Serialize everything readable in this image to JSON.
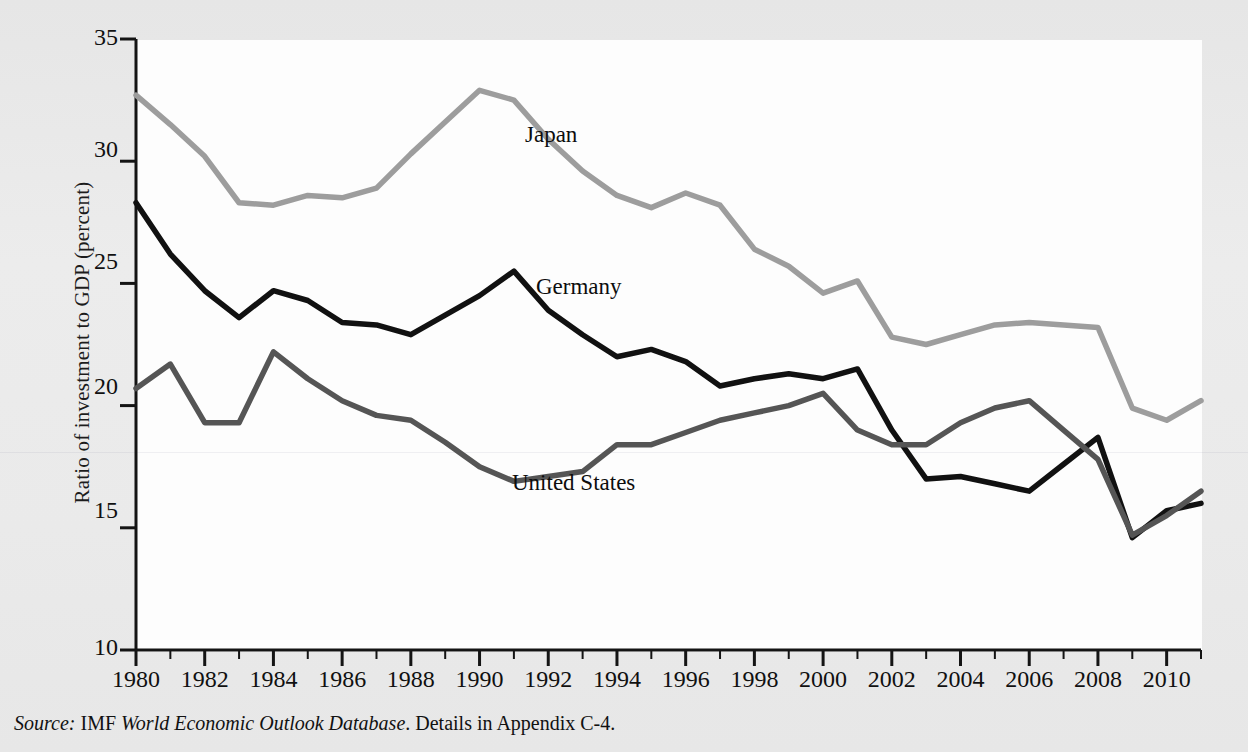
{
  "figure": {
    "background_color": "#e9e9e9",
    "plot_background_color": "#fdfdfd",
    "source_prefix": "Source:",
    "source_agency": " IMF ",
    "source_database": "World Economic Outlook Database",
    "source_tail": ". Details in Appendix C-4."
  },
  "axes": {
    "y_title": "Ratio of investment to GDP (percent)",
    "x_title": "",
    "y_ticks": [
      "35",
      "30",
      "25",
      "20",
      "15",
      "10"
    ],
    "x_ticks": [
      "1980",
      "1982",
      "1984",
      "1986",
      "1988",
      "1990",
      "1992",
      "1994",
      "1996",
      "1998",
      "2000",
      "2002",
      "2004",
      "2006",
      "2008",
      "2010"
    ]
  },
  "series_labels": {
    "japan": "Japan",
    "germany": "Germany",
    "united_states": "United States"
  },
  "chart_data": {
    "type": "line",
    "title": "",
    "xlabel": "",
    "ylabel": "Ratio of investment to GDP (percent)",
    "xlim": [
      1980,
      2011
    ],
    "ylim": [
      10,
      35
    ],
    "ytick_step": 5,
    "xtick_step": 2,
    "xtick_minor_step": 1,
    "grid": false,
    "legend": "inline-labels",
    "x": [
      1980,
      1981,
      1982,
      1983,
      1984,
      1985,
      1986,
      1987,
      1988,
      1989,
      1990,
      1991,
      1992,
      1993,
      1994,
      1995,
      1996,
      1997,
      1998,
      1999,
      2000,
      2001,
      2002,
      2003,
      2004,
      2005,
      2006,
      2007,
      2008,
      2009,
      2010,
      2011
    ],
    "series": [
      {
        "name": "Japan",
        "color": "#9d9d9d",
        "values": [
          32.7,
          31.5,
          30.2,
          28.3,
          28.2,
          28.6,
          28.5,
          28.9,
          30.3,
          31.6,
          32.9,
          32.5,
          30.9,
          29.6,
          28.6,
          28.1,
          28.7,
          28.2,
          26.4,
          25.7,
          24.6,
          25.1,
          22.8,
          22.5,
          22.9,
          23.3,
          23.4,
          23.3,
          23.2,
          19.9,
          19.4,
          20.2
        ]
      },
      {
        "name": "Germany",
        "color": "#111111",
        "values": [
          28.3,
          26.2,
          24.7,
          23.6,
          24.7,
          24.3,
          23.4,
          23.3,
          22.9,
          23.7,
          24.5,
          25.5,
          23.9,
          22.9,
          22.0,
          22.3,
          21.8,
          20.8,
          21.1,
          21.3,
          21.1,
          21.5,
          19.0,
          17.0,
          17.1,
          16.8,
          16.5,
          17.6,
          18.7,
          14.6,
          15.7,
          16.0
        ]
      },
      {
        "name": "United States",
        "color": "#555555",
        "values": [
          20.7,
          21.7,
          19.3,
          19.3,
          22.2,
          21.1,
          20.2,
          19.6,
          19.4,
          18.5,
          17.5,
          16.9,
          17.1,
          17.3,
          18.4,
          18.4,
          18.9,
          19.4,
          19.7,
          20.0,
          20.5,
          19.0,
          18.4,
          18.4,
          19.3,
          19.9,
          20.2,
          19.0,
          17.8,
          14.7,
          15.5,
          16.5
        ]
      }
    ]
  }
}
